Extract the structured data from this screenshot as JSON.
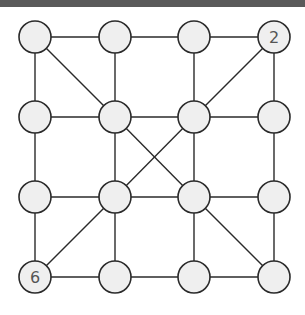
{
  "diagram": {
    "type": "graph",
    "grid": {
      "cols": 4,
      "rows": 4
    },
    "col_x": [
      35,
      115,
      194,
      274
    ],
    "row_y": [
      37,
      117,
      197,
      277
    ],
    "node_radius": 16,
    "colors": {
      "node_fill": "#efefef",
      "stroke": "#2a2a2a",
      "label": "#555555",
      "topbar": "#5a5a5a"
    },
    "nodes": [
      {
        "id": "r0c0",
        "row": 0,
        "col": 0,
        "label": ""
      },
      {
        "id": "r0c1",
        "row": 0,
        "col": 1,
        "label": ""
      },
      {
        "id": "r0c2",
        "row": 0,
        "col": 2,
        "label": ""
      },
      {
        "id": "r0c3",
        "row": 0,
        "col": 3,
        "label": "2"
      },
      {
        "id": "r1c0",
        "row": 1,
        "col": 0,
        "label": ""
      },
      {
        "id": "r1c1",
        "row": 1,
        "col": 1,
        "label": ""
      },
      {
        "id": "r1c2",
        "row": 1,
        "col": 2,
        "label": ""
      },
      {
        "id": "r1c3",
        "row": 1,
        "col": 3,
        "label": ""
      },
      {
        "id": "r2c0",
        "row": 2,
        "col": 0,
        "label": ""
      },
      {
        "id": "r2c1",
        "row": 2,
        "col": 1,
        "label": ""
      },
      {
        "id": "r2c2",
        "row": 2,
        "col": 2,
        "label": ""
      },
      {
        "id": "r2c3",
        "row": 2,
        "col": 3,
        "label": ""
      },
      {
        "id": "r3c0",
        "row": 3,
        "col": 0,
        "label": "6"
      },
      {
        "id": "r3c1",
        "row": 3,
        "col": 1,
        "label": ""
      },
      {
        "id": "r3c2",
        "row": 3,
        "col": 2,
        "label": ""
      },
      {
        "id": "r3c3",
        "row": 3,
        "col": 3,
        "label": ""
      }
    ],
    "edges": [
      [
        "r0c0",
        "r0c1"
      ],
      [
        "r0c1",
        "r0c2"
      ],
      [
        "r0c2",
        "r0c3"
      ],
      [
        "r1c0",
        "r1c1"
      ],
      [
        "r1c1",
        "r1c2"
      ],
      [
        "r1c2",
        "r1c3"
      ],
      [
        "r2c0",
        "r2c1"
      ],
      [
        "r2c1",
        "r2c2"
      ],
      [
        "r2c2",
        "r2c3"
      ],
      [
        "r3c0",
        "r3c1"
      ],
      [
        "r3c1",
        "r3c2"
      ],
      [
        "r3c2",
        "r3c3"
      ],
      [
        "r0c0",
        "r1c0"
      ],
      [
        "r1c0",
        "r2c0"
      ],
      [
        "r2c0",
        "r3c0"
      ],
      [
        "r0c1",
        "r1c1"
      ],
      [
        "r1c1",
        "r2c1"
      ],
      [
        "r2c1",
        "r3c1"
      ],
      [
        "r0c2",
        "r1c2"
      ],
      [
        "r1c2",
        "r2c2"
      ],
      [
        "r2c2",
        "r3c2"
      ],
      [
        "r0c3",
        "r1c3"
      ],
      [
        "r1c3",
        "r2c3"
      ],
      [
        "r2c3",
        "r3c3"
      ],
      [
        "r0c0",
        "r1c1"
      ],
      [
        "r0c3",
        "r1c2"
      ],
      [
        "r1c1",
        "r2c2"
      ],
      [
        "r1c2",
        "r2c1"
      ],
      [
        "r2c1",
        "r3c0"
      ],
      [
        "r2c2",
        "r3c3"
      ]
    ]
  }
}
